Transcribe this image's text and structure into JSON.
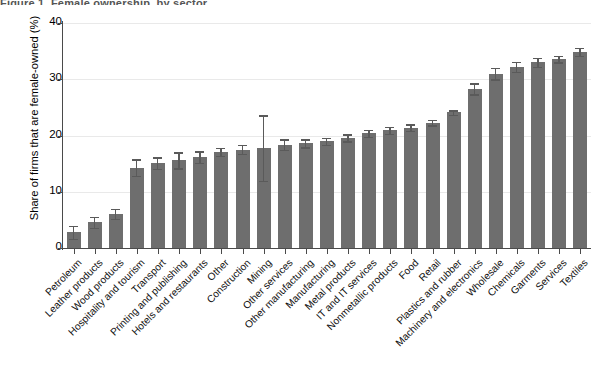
{
  "figure": {
    "title_clipped": "Figure 1.  Female ownership, by sector",
    "background": "#ffffff",
    "bar_color": "#6e6e6e",
    "error_bar_color": "#5a5a5a",
    "axis_color": "#4a4a4a",
    "grid_color": "#e9e9e9"
  },
  "axes": {
    "ylabel": "Share of firms that are female-owned (%)",
    "xlabel": "",
    "yticks": [
      0,
      10,
      20,
      30,
      40
    ],
    "ytick_labels": [
      "0",
      "10",
      "20",
      "30",
      "40"
    ],
    "ylim": [
      0,
      40
    ],
    "grid": "horizontal"
  },
  "chart_data": {
    "type": "bar",
    "title": "Figure 1.  Female ownership, by sector",
    "xlabel": "",
    "ylabel": "Share of firms that are female-owned (%)",
    "ylim": [
      0,
      40
    ],
    "grid": true,
    "legend": "none",
    "error_bars": "95% confidence interval",
    "categories": [
      "Petroleum",
      "Leather products",
      "Wood products",
      "Hospitality and tourism",
      "Transport",
      "Printing and publishing",
      "Hotels and restaurants",
      "Other",
      "Construction",
      "Mining",
      "Other services",
      "Other manufacturing",
      "Manufacturing",
      "Metal products",
      "IT and IT services",
      "Nonmetallic products",
      "Food",
      "Retail",
      "Plastics and rubber",
      "Machinery and electronics",
      "Wholesale",
      "Chemicals",
      "Garments",
      "Services",
      "Textiles"
    ],
    "values": [
      2.8,
      4.6,
      6.1,
      14.3,
      15.1,
      15.6,
      16.2,
      17.1,
      17.5,
      17.8,
      18.4,
      18.6,
      19.0,
      19.6,
      20.4,
      20.9,
      21.4,
      22.3,
      24.1,
      28.3,
      31.0,
      32.2,
      33.0,
      33.6,
      34.9
    ],
    "errors_low": [
      1.6,
      3.6,
      5.2,
      12.8,
      14.1,
      14.2,
      15.2,
      16.4,
      16.7,
      12.0,
      17.5,
      17.9,
      18.4,
      19.0,
      19.8,
      20.3,
      20.8,
      21.8,
      23.7,
      27.3,
      30.0,
      31.3,
      32.2,
      33.0,
      34.2
    ],
    "errors_high": [
      4.0,
      5.6,
      7.0,
      15.8,
      16.1,
      17.0,
      17.2,
      17.8,
      18.3,
      23.6,
      19.3,
      19.3,
      19.6,
      20.2,
      21.0,
      21.5,
      22.0,
      22.8,
      24.5,
      29.3,
      32.0,
      33.1,
      33.8,
      34.2,
      35.6
    ]
  }
}
